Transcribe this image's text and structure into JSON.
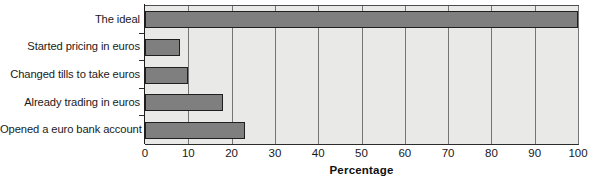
{
  "chart_data": {
    "type": "bar",
    "orientation": "horizontal",
    "title": "",
    "xlabel": "Percentage",
    "ylabel": "",
    "xlim": [
      0,
      100
    ],
    "grid": true,
    "legend": false,
    "categories": [
      "The ideal",
      "Started pricing in euros",
      "Changed tills to take euros",
      "Already trading in euros",
      "Opened a euro bank account"
    ],
    "values": [
      100,
      8,
      10,
      18,
      23
    ],
    "xticks": [
      0,
      10,
      20,
      30,
      40,
      50,
      60,
      70,
      80,
      90,
      100
    ],
    "xticklabels": [
      "0",
      "10",
      "20",
      "30",
      "40",
      "50",
      "60",
      "70",
      "80",
      "90",
      "100"
    ],
    "colors": {
      "bar_fill": "#7f7f7f",
      "bar_edge": "#1f1f1f",
      "plot_background": "#e9e9e7",
      "gridline": "#757575",
      "axis": "#1c1c1c",
      "text": "#161616",
      "page_background": "#ffffff"
    }
  }
}
